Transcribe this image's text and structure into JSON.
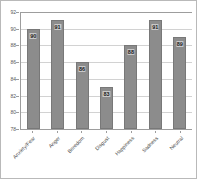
{
  "chart_data": {
    "type": "bar",
    "title": "",
    "subtitle": "",
    "xlabel": "",
    "ylabel": "",
    "categories": [
      "Anxiety/Fear",
      "Anger",
      "Boredom",
      "Disgust",
      "Happiness",
      "Sadness",
      "Neutral"
    ],
    "values": [
      90,
      91,
      86,
      83,
      88,
      91,
      89
    ],
    "data_labels": [
      "90",
      "91",
      "86",
      "83",
      "88",
      "91",
      "89"
    ],
    "ylim": [
      78,
      92
    ],
    "yticks": [
      78,
      80,
      82,
      84,
      86,
      88,
      90,
      92
    ],
    "ytick_labels": [
      "78",
      "80",
      "82",
      "84",
      "86",
      "88",
      "90",
      "92"
    ],
    "grid": true,
    "grid_axis": "y",
    "legend": false,
    "legend_position": "none",
    "bar_color": "#8c8c8c",
    "bar_edge_color": "#787878",
    "label_background_color": "#c9c9c9",
    "gridline_color": "#d2d2d2",
    "axis_color": "#9d9d9d",
    "frame_color": "#b9b9b9",
    "background_color": "#ffffff"
  }
}
